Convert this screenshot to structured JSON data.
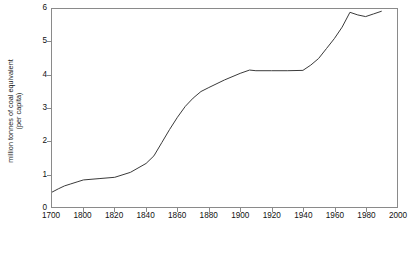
{
  "chart_data": {
    "type": "line",
    "title": "",
    "subtitle": "",
    "xlabel": "",
    "ylabel": "million tonnes of coal equivalent (per capita)",
    "ylabel_line1": "million tonnes of coal equivalent",
    "ylabel_line2": "(per capita)",
    "xlim": [
      1700,
      2000
    ],
    "ylim": [
      0,
      6
    ],
    "grid": false,
    "legend": null,
    "legend_position": "none",
    "axis_spacing_note": "x tick labels are evenly spaced although 1700-1800 spans 100 years and all later intervals span 20 years",
    "xticks": [
      "1700",
      "1800",
      "1820",
      "1840",
      "1860",
      "1880",
      "1900",
      "1920",
      "1940",
      "1960",
      "1980",
      "2000"
    ],
    "yticks": [
      "0",
      "1",
      "2",
      "3",
      "4",
      "5",
      "6"
    ],
    "series": [
      {
        "name": "energy consumption per capita",
        "color": "#3a3a3a",
        "x": [
          1700,
          1720,
          1740,
          1760,
          1780,
          1800,
          1810,
          1820,
          1830,
          1840,
          1845,
          1850,
          1855,
          1860,
          1865,
          1870,
          1875,
          1880,
          1890,
          1900,
          1906,
          1910,
          1920,
          1930,
          1940,
          1945,
          1950,
          1955,
          1960,
          1965,
          1970,
          1975,
          1980,
          1985,
          1990
        ],
        "values": [
          0.45,
          0.55,
          0.64,
          0.7,
          0.76,
          0.82,
          0.86,
          0.9,
          1.05,
          1.32,
          1.55,
          1.95,
          2.35,
          2.72,
          3.05,
          3.3,
          3.5,
          3.62,
          3.85,
          4.05,
          4.15,
          4.13,
          4.13,
          4.13,
          4.14,
          4.3,
          4.5,
          4.8,
          5.1,
          5.45,
          5.9,
          5.82,
          5.77,
          5.85,
          5.93
        ]
      }
    ]
  },
  "axis_titles": {
    "y_line1": "million tonnes of coal equivalent",
    "y_line2": "(per capita)"
  },
  "caption": {
    "text": ""
  }
}
